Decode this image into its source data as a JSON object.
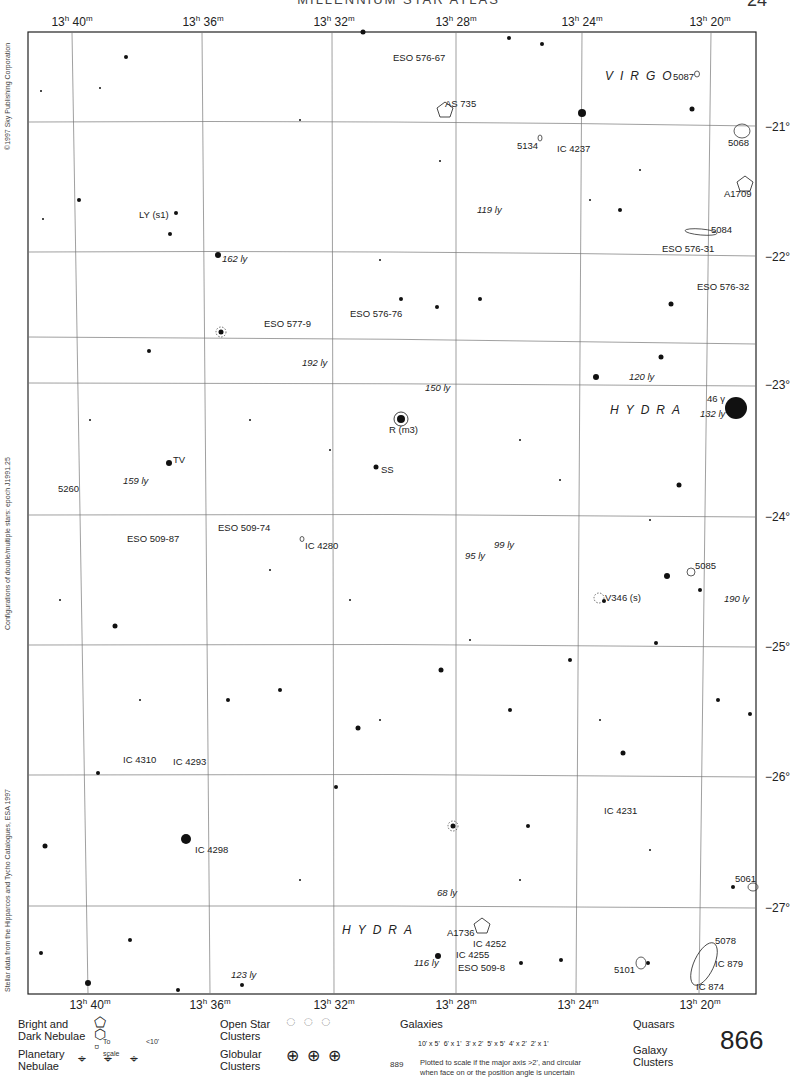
{
  "header": {
    "title": "MILLENNIUM STAR ATLAS",
    "page_corner": "24"
  },
  "ra_labels_top": [
    {
      "h": "13",
      "m": "40",
      "x": 72
    },
    {
      "h": "13",
      "m": "36",
      "x": 203
    },
    {
      "h": "13",
      "m": "32",
      "x": 334
    },
    {
      "h": "13",
      "m": "28",
      "x": 456
    },
    {
      "h": "13",
      "m": "24",
      "x": 582
    },
    {
      "h": "13",
      "m": "20",
      "x": 710
    }
  ],
  "ra_labels_bottom": [
    {
      "h": "13",
      "m": "40",
      "x": 90
    },
    {
      "h": "13",
      "m": "36",
      "x": 210
    },
    {
      "h": "13",
      "m": "32",
      "x": 334
    },
    {
      "h": "13",
      "m": "28",
      "x": 456
    },
    {
      "h": "13",
      "m": "24",
      "x": 578
    },
    {
      "h": "13",
      "m": "20",
      "x": 700
    }
  ],
  "dec_labels": [
    {
      "text": "−21°",
      "y": 127
    },
    {
      "text": "−22°",
      "y": 257
    },
    {
      "text": "−23°",
      "y": 385
    },
    {
      "text": "−24°",
      "y": 517
    },
    {
      "text": "−25°",
      "y": 647
    },
    {
      "text": "−26°",
      "y": 777
    },
    {
      "text": "−27°",
      "y": 908
    }
  ],
  "side_texts": {
    "copyright": "©1997 Sky Publishing Corporation",
    "epoch": "Configurations of double/multiple stars: epoch J1991.25",
    "source": "Stellar data from the Hipparcos and Tycho Catalogues, ESA 1997"
  },
  "constellations": [
    {
      "name": "VIRGO",
      "x": 605,
      "y": 80
    },
    {
      "name": "HYDRA",
      "x": 610,
      "y": 414
    },
    {
      "name": "HYDRA",
      "x": 342,
      "y": 934
    }
  ],
  "objects": [
    {
      "label": "ESO 576-67",
      "x": 393,
      "y": 61
    },
    {
      "label": "AS 735",
      "x": 445,
      "y": 107
    },
    {
      "label": "5087",
      "x": 673,
      "y": 80
    },
    {
      "label": "5068",
      "x": 728,
      "y": 146
    },
    {
      "label": "5134",
      "x": 517,
      "y": 149
    },
    {
      "label": "IC 4237",
      "x": 557,
      "y": 152
    },
    {
      "label": "A1709",
      "x": 724,
      "y": 197
    },
    {
      "label": "5084",
      "x": 711,
      "y": 233
    },
    {
      "label": "ESO 576-31",
      "x": 662,
      "y": 252
    },
    {
      "label": "ESO 576-32",
      "x": 697,
      "y": 290
    },
    {
      "label": "ESO 577-9",
      "x": 264,
      "y": 327
    },
    {
      "label": "ESO 576-76",
      "x": 350,
      "y": 317
    },
    {
      "label": "R (m3)",
      "x": 389,
      "y": 433
    },
    {
      "label": "SS",
      "x": 381,
      "y": 473
    },
    {
      "label": "TV",
      "x": 173,
      "y": 463
    },
    {
      "label": "46 γ",
      "x": 707,
      "y": 402
    },
    {
      "label": "5260",
      "x": 58,
      "y": 492
    },
    {
      "label": "ESO 509-87",
      "x": 127,
      "y": 542
    },
    {
      "label": "ESO 509-74",
      "x": 218,
      "y": 531
    },
    {
      "label": "IC 4280",
      "x": 305,
      "y": 549
    },
    {
      "label": "5085",
      "x": 695,
      "y": 569
    },
    {
      "label": "V346 (s)",
      "x": 605,
      "y": 601
    },
    {
      "label": "IC 4310",
      "x": 123,
      "y": 763
    },
    {
      "label": "IC 4293",
      "x": 173,
      "y": 765
    },
    {
      "label": "IC 4231",
      "x": 604,
      "y": 814
    },
    {
      "label": "IC 4298",
      "x": 195,
      "y": 853
    },
    {
      "label": "5061",
      "x": 735,
      "y": 882
    },
    {
      "label": "A1736",
      "x": 447,
      "y": 936
    },
    {
      "label": "IC 4252",
      "x": 473,
      "y": 947
    },
    {
      "label": "IC 4255",
      "x": 456,
      "y": 958
    },
    {
      "label": "ESO 509-8",
      "x": 458,
      "y": 971
    },
    {
      "label": "5078",
      "x": 715,
      "y": 944
    },
    {
      "label": "IC 879",
      "x": 715,
      "y": 967
    },
    {
      "label": "5101",
      "x": 614,
      "y": 973
    },
    {
      "label": "IC 874",
      "x": 696,
      "y": 990
    },
    {
      "label": "LY (s1)",
      "x": 139,
      "y": 218
    }
  ],
  "distances": [
    {
      "text": "119 ly",
      "x": 477,
      "y": 213
    },
    {
      "text": "162 ly",
      "x": 222,
      "y": 262
    },
    {
      "text": "192 ly",
      "x": 302,
      "y": 366
    },
    {
      "text": "150 ly",
      "x": 425,
      "y": 391
    },
    {
      "text": "120 ly",
      "x": 629,
      "y": 380
    },
    {
      "text": "132 ly",
      "x": 700,
      "y": 417
    },
    {
      "text": "159 ly",
      "x": 123,
      "y": 484
    },
    {
      "text": "99 ly",
      "x": 494,
      "y": 548
    },
    {
      "text": "95 ly",
      "x": 465,
      "y": 559
    },
    {
      "text": "190 ly",
      "x": 724,
      "y": 602
    },
    {
      "text": "68 ly",
      "x": 437,
      "y": 896
    },
    {
      "text": "116 ly",
      "x": 414,
      "y": 966
    },
    {
      "text": "123 ly",
      "x": 231,
      "y": 978
    }
  ],
  "legend": {
    "nebulae_title": "Bright and Dark Nebulae",
    "nebulae_scale": "To scale",
    "nebulae_small": "<10'",
    "planetary_title": "Planetary Nebulae",
    "planetary_sizes": [
      ">100\"",
      "100\"–30\"",
      "<30\""
    ],
    "open_title": "Open Star Clusters",
    "globular_title": "Globular Clusters",
    "globular_scale": "To scale",
    "globular_small": "<5'",
    "galaxies_title": "Galaxies",
    "galaxy_sizes": [
      "10' x 5'",
      "6' x 1'",
      "3' x 2'",
      "5' x 5'",
      "4' x 2'",
      "2' x 1'"
    ],
    "galaxy_note_1": "Plotted to scale if the major axis >2', and circular",
    "galaxy_note_2": "when face on or the position angle is uncertain",
    "quasars_title": "Quasars",
    "clusters_title": "Galaxy Clusters"
  },
  "page_number": "866",
  "cross_ref": "889"
}
